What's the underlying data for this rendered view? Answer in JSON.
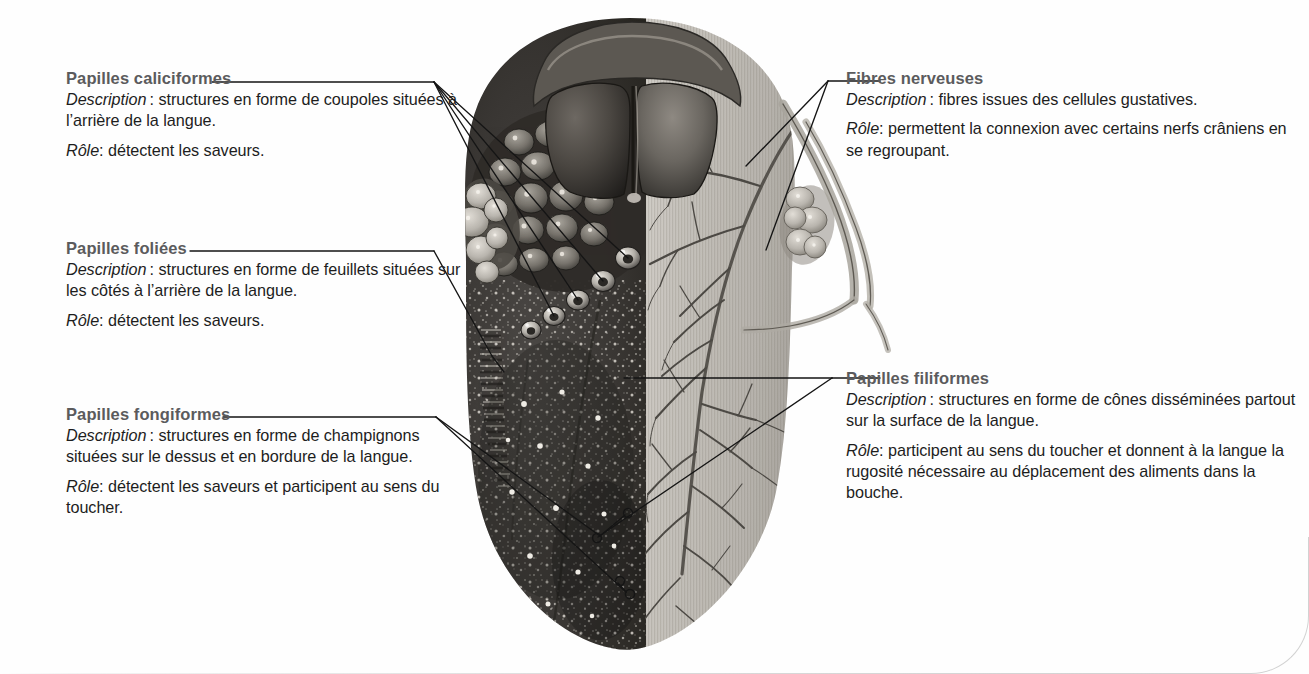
{
  "figure": {
    "view": "vue dorsale, moitié gauche en surface, moitié droite en dissection nerveuse"
  },
  "callouts": [
    {
      "id": "caliciformes",
      "title": "Papilles caliciformes",
      "description_label": "Description",
      "description_text": "structures en forme de coupoles situées à l’arrière de la langue.",
      "role_label": "Rôle",
      "role_text": "détectent les saveurs."
    },
    {
      "id": "foliees",
      "title": "Papilles foliées",
      "description_label": "Description",
      "description_text": "structures en forme de feuillets situées sur les côtés à l’arrière de la langue.",
      "role_label": "Rôle",
      "role_text": "détectent les saveurs."
    },
    {
      "id": "fongiformes",
      "title": "Papilles fongiformes",
      "description_label": "Description",
      "description_text": "structures en forme de champignons situées sur le dessus et en bordure de la langue.",
      "role_label": "Rôle",
      "role_text": "détectent les saveurs et participent au sens du toucher."
    },
    {
      "id": "fibres",
      "title": "Fibres nerveuses",
      "description_label": "Description",
      "description_text": "fibres issues des cellules gustatives.",
      "role_label": "Rôle",
      "role_text": "permettent la connexion avec certains nerfs crâniens en se regroupant."
    },
    {
      "id": "filiformes",
      "title": "Papilles filiformes",
      "description_label": "Description",
      "description_text": "structures en forme de cônes disséminées partout sur la surface de la langue.",
      "role_label": "Rôle",
      "role_text": "participent au sens du toucher et donnent à la langue la rugosité nécessaire au déplacement des aliments dans la bouche."
    }
  ],
  "colors": {
    "heading": "#5b5b5d",
    "body": "#1d1d1d",
    "leader_line": "#1a1a1a",
    "page_border": "#d2d2d2",
    "tongue_dark": "#3a3a3a",
    "tongue_light": "#b6b3ae",
    "background": "#ffffff"
  }
}
